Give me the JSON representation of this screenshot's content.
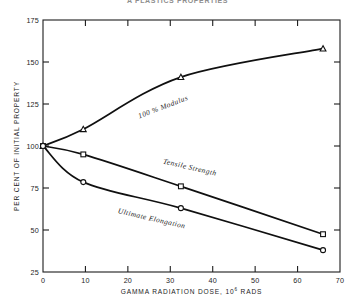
{
  "title_strip": {
    "text": "A  PLASTICS  PROPERTIES"
  },
  "chart_data": {
    "type": "line",
    "title": "",
    "xlabel": "GAMMA RADIATION DOSE, 10",
    "xlabel_superscript": "6",
    "xlabel_tail": " RADS",
    "ylabel": "PER CENT OF INITIAL PROPERTY",
    "xlim": [
      0,
      70
    ],
    "ylim": [
      25,
      175
    ],
    "xticks": [
      0,
      10,
      20,
      30,
      40,
      50,
      60,
      70
    ],
    "xtick_labels": [
      "0",
      "10",
      "20",
      "30",
      "40",
      "50",
      "60",
      "70"
    ],
    "yticks": [
      25,
      50,
      75,
      100,
      125,
      150,
      175
    ],
    "ytick_labels": [
      "25",
      "50",
      "75",
      "100",
      "125",
      "150",
      "175"
    ],
    "grid": false,
    "legend": "inline-annotations",
    "series": [
      {
        "name": "100 % Modulus",
        "marker": "triangle",
        "label_x": 28.5,
        "label_y": 122,
        "label_rotation": -21,
        "x": [
          0,
          9.5,
          32.5,
          66
        ],
        "y": [
          100,
          110,
          141,
          158
        ]
      },
      {
        "name": "Tensile Strength",
        "marker": "square",
        "label_x": 34.5,
        "label_y": 86,
        "label_rotation": 13,
        "x": [
          0,
          9.5,
          32.5,
          66
        ],
        "y": [
          100,
          95,
          76,
          47.5
        ]
      },
      {
        "name": "Ultimate Elongation",
        "marker": "circle",
        "label_x": 25.5,
        "label_y": 55.5,
        "label_rotation": 13,
        "x": [
          0,
          9.5,
          32.5,
          66
        ],
        "y": [
          100,
          78.5,
          63,
          38
        ]
      }
    ]
  }
}
